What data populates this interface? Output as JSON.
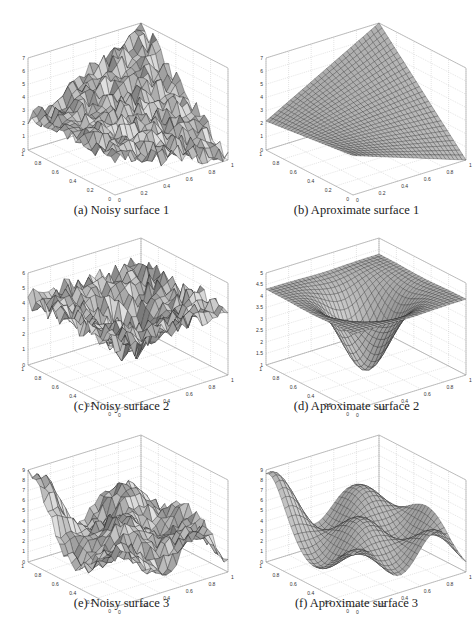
{
  "figure": {
    "panels": [
      {
        "id": "a",
        "caption": "(a) Noisy surface 1",
        "kind": "noisy",
        "surface": "ridge",
        "zticks": [
          "0",
          "1",
          "2",
          "3",
          "4",
          "5",
          "6",
          "7"
        ]
      },
      {
        "id": "b",
        "caption": "(b) Aproximate surface 1",
        "kind": "smooth",
        "surface": "ridge",
        "zticks": [
          "0",
          "1",
          "2",
          "3",
          "4",
          "5",
          "6",
          "7"
        ]
      },
      {
        "id": "c",
        "caption": "(c) Noisy surface 2",
        "kind": "noisy",
        "surface": "bowl",
        "zticks": [
          "0",
          "1",
          "2",
          "3",
          "4",
          "5",
          "6"
        ]
      },
      {
        "id": "d",
        "caption": "(d) Aproximate surface 2",
        "kind": "smooth",
        "surface": "bowl",
        "zticks": [
          "1",
          "1.5",
          "2",
          "2.5",
          "3",
          "3.5",
          "4",
          "4.5",
          "5"
        ]
      },
      {
        "id": "e",
        "caption": "(e) Noisy surface 3",
        "kind": "noisy",
        "surface": "waves",
        "zticks": [
          "0",
          "1",
          "2",
          "3",
          "4",
          "5",
          "6",
          "7",
          "8",
          "9"
        ]
      },
      {
        "id": "f",
        "caption": "(f) Aproximate surface 3",
        "kind": "smooth",
        "surface": "waves",
        "zticks": [
          "0",
          "1",
          "2",
          "3",
          "4",
          "5",
          "6",
          "7",
          "8",
          "9"
        ]
      }
    ],
    "xyticks": [
      "0",
      "0.2",
      "0.4",
      "0.6",
      "0.8",
      "1"
    ]
  },
  "chart_data": [
    {
      "type": "surface",
      "title": "(a) Noisy surface 1",
      "xlabel": "",
      "ylabel": "",
      "zlabel": "",
      "xlim": [
        0,
        1
      ],
      "ylim": [
        0,
        1
      ],
      "zlim": [
        0,
        7
      ],
      "xticks": [
        0,
        0.2,
        0.4,
        0.6,
        0.8,
        1
      ],
      "yticks": [
        0,
        0.2,
        0.4,
        0.6,
        0.8,
        1
      ],
      "zticks": [
        0,
        1,
        2,
        3,
        4,
        5,
        6,
        7
      ],
      "grid": true,
      "description": "Noisy surface rising from about 2 at the left corner to a peak of about 7 at the back corner, descending to about 0 at the right corner"
    },
    {
      "type": "surface",
      "title": "(b) Aproximate surface 1",
      "xlim": [
        0,
        1
      ],
      "ylim": [
        0,
        1
      ],
      "zlim": [
        0,
        7
      ],
      "xticks": [
        0,
        0.2,
        0.4,
        0.6,
        0.8,
        1
      ],
      "yticks": [
        0,
        0.2,
        0.4,
        0.6,
        0.8,
        1
      ],
      "zticks": [
        0,
        1,
        2,
        3,
        4,
        5,
        6,
        7
      ],
      "grid": true,
      "description": "Smooth saddle-like plane: z≈2 at left corner, ≈7 at back corner, ≈0 at right corner, ≈3 at front corner"
    },
    {
      "type": "surface",
      "title": "(c) Noisy surface 2",
      "xlim": [
        0,
        1
      ],
      "ylim": [
        0,
        1
      ],
      "zlim": [
        0,
        6
      ],
      "xticks": [
        0,
        0.2,
        0.4,
        0.6,
        0.8,
        1
      ],
      "yticks": [
        0,
        0.2,
        0.4,
        0.6,
        0.8,
        1
      ],
      "zticks": [
        0,
        1,
        2,
        3,
        4,
        5,
        6
      ],
      "grid": true,
      "description": "Noisy bowl: edges near 4-5, center dipping to about 1"
    },
    {
      "type": "surface",
      "title": "(d) Aproximate surface 2",
      "xlim": [
        0,
        1
      ],
      "ylim": [
        0,
        1
      ],
      "zlim": [
        1,
        5
      ],
      "xticks": [
        0,
        0.2,
        0.4,
        0.6,
        0.8,
        1
      ],
      "yticks": [
        0,
        0.2,
        0.4,
        0.6,
        0.8,
        1
      ],
      "zticks": [
        1,
        1.5,
        2,
        2.5,
        3,
        3.5,
        4,
        4.5,
        5
      ],
      "grid": true,
      "description": "Smooth bowl: edges around 4-4.5, minimum about 1 at center"
    },
    {
      "type": "surface",
      "title": "(e) Noisy surface 3",
      "xlim": [
        0,
        1
      ],
      "ylim": [
        0,
        1
      ],
      "zlim": [
        0,
        9
      ],
      "xticks": [
        0,
        0.2,
        0.4,
        0.6,
        0.8,
        1
      ],
      "yticks": [
        0,
        0.2,
        0.4,
        0.6,
        0.8,
        1
      ],
      "zticks": [
        0,
        1,
        2,
        3,
        4,
        5,
        6,
        7,
        8,
        9
      ],
      "grid": true,
      "description": "Noisy wavy surface with corner high near 8-9 on the left, oscillating between about 1 and 7"
    },
    {
      "type": "surface",
      "title": "(f) Aproximate surface 3",
      "xlim": [
        0,
        1
      ],
      "ylim": [
        0,
        1
      ],
      "zlim": [
        0,
        9
      ],
      "xticks": [
        0,
        0.2,
        0.4,
        0.6,
        0.8,
        1
      ],
      "yticks": [
        0,
        0.2,
        0.4,
        0.6,
        0.8,
        1
      ],
      "zticks": [
        0,
        1,
        2,
        3,
        4,
        5,
        6,
        7,
        8,
        9
      ],
      "grid": true,
      "description": "Smooth wavy surface: left corner near 8, humps near 6-7, troughs near 1-2"
    }
  ]
}
